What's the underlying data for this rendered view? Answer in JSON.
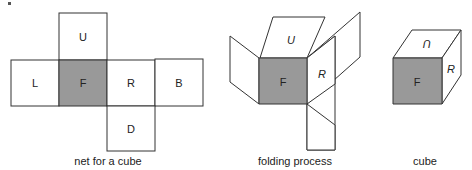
{
  "colors": {
    "face_shaded": "#999999",
    "stroke": "#333333",
    "background": "#ffffff"
  },
  "net": {
    "caption": "net for a cube",
    "faces": {
      "up": "U",
      "left": "L",
      "front": "F",
      "right": "R",
      "back": "B",
      "down": "D"
    }
  },
  "folding": {
    "caption": "folding process",
    "faces": {
      "up": "U",
      "front": "F",
      "right": "R"
    }
  },
  "cube": {
    "caption": "cube",
    "faces": {
      "up": "U",
      "front": "F",
      "right": "R"
    }
  }
}
